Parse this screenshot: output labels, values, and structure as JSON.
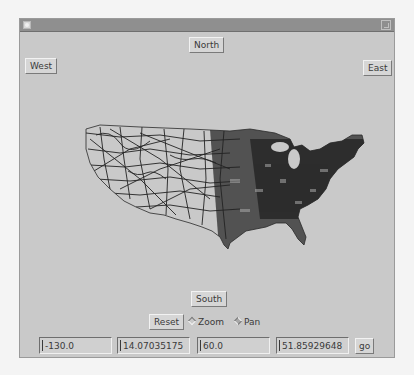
{
  "window": {
    "menu_icon": "window-menu-icon",
    "maximize_icon": "maximize-icon"
  },
  "navigation": {
    "north_label": "North",
    "south_label": "South",
    "west_label": "West",
    "east_label": "East"
  },
  "map": {
    "description": "Road network map of the contiguous United States",
    "line_color": "#1e1e1e"
  },
  "controls": {
    "reset_label": "Reset",
    "mode_options": [
      {
        "label": "Zoom",
        "selected": false
      },
      {
        "label": "Pan",
        "selected": true
      }
    ]
  },
  "coordinates": {
    "fields": [
      {
        "name": "min-x",
        "value": "-130.0"
      },
      {
        "name": "min-y",
        "value": "14.07035175"
      },
      {
        "name": "max-x",
        "value": "60.0"
      },
      {
        "name": "max-y",
        "value": "51.85929648"
      }
    ],
    "go_label": "go"
  },
  "colors": {
    "window_bg": "#c9c9c9",
    "titlebar_bg": "#8f8f8f",
    "page_bg": "#f4f4f4"
  }
}
